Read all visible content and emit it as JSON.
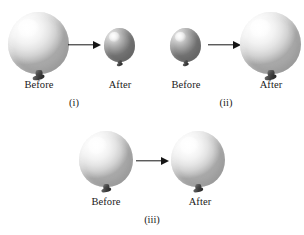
{
  "figure": {
    "background_color": "#ffffff",
    "width": 304,
    "height": 235,
    "text_color": "#1a1a1a",
    "arrow_color": "#161616"
  },
  "panels": [
    {
      "id": "i",
      "label": "(i)",
      "before": {
        "label": "Before",
        "balloon_shade": "white",
        "balloon_size": "large"
      },
      "after": {
        "label": "After",
        "balloon_shade": "gray",
        "balloon_size": "small"
      }
    },
    {
      "id": "ii",
      "label": "(ii)",
      "before": {
        "label": "Before",
        "balloon_shade": "gray",
        "balloon_size": "small"
      },
      "after": {
        "label": "After",
        "balloon_shade": "white",
        "balloon_size": "large"
      }
    },
    {
      "id": "iii",
      "label": "(iii)",
      "before": {
        "label": "Before",
        "balloon_shade": "white",
        "balloon_size": "medium"
      },
      "after": {
        "label": "After",
        "balloon_shade": "white",
        "balloon_size": "medium"
      }
    }
  ]
}
